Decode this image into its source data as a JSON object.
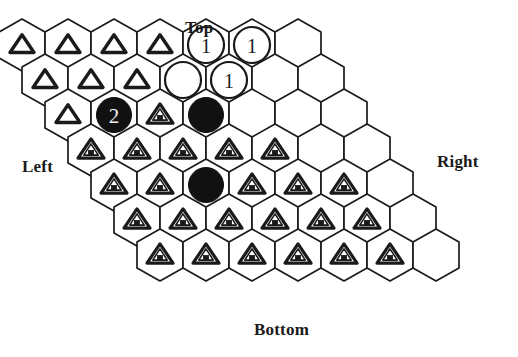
{
  "figure": {
    "kind": "hex-board",
    "orientation": "pointy-top",
    "rows": 7,
    "cols": 7,
    "colors": {
      "line": "#1a1a1a",
      "background": "#ffffff",
      "stone_dark": "#111111",
      "numeral_light": "#f2f2f2"
    },
    "geometry": {
      "hex_width": 46,
      "hex_height": 52,
      "row_step_y": 35,
      "row_offset_x": 23,
      "origin_x": 22,
      "origin_y": 45
    }
  },
  "edge_labels": {
    "top": "Top",
    "bottom": "Bottom",
    "left": "Left",
    "right": "Right"
  },
  "legend": {
    "triangle_open": "open-triangle-marker",
    "triangle_house": "house-triangle-marker",
    "ring": "white-ring-stone",
    "stone": "black-stone",
    "empty": "empty-cell"
  },
  "board": {
    "cells": [
      [
        {
          "type": "triangle_open",
          "label": ""
        },
        {
          "type": "triangle_open",
          "label": ""
        },
        {
          "type": "triangle_open",
          "label": ""
        },
        {
          "type": "triangle_open",
          "label": ""
        },
        {
          "type": "ring",
          "label": "1"
        },
        {
          "type": "ring",
          "label": "1"
        },
        {
          "type": "empty",
          "label": ""
        }
      ],
      [
        {
          "type": "triangle_open",
          "label": ""
        },
        {
          "type": "triangle_open",
          "label": ""
        },
        {
          "type": "triangle_open",
          "label": ""
        },
        {
          "type": "ring",
          "label": ""
        },
        {
          "type": "ring",
          "label": "1"
        },
        {
          "type": "empty",
          "label": ""
        },
        {
          "type": "empty",
          "label": ""
        }
      ],
      [
        {
          "type": "triangle_open",
          "label": ""
        },
        {
          "type": "stone",
          "label": "2"
        },
        {
          "type": "triangle_house",
          "label": ""
        },
        {
          "type": "stone",
          "label": ""
        },
        {
          "type": "empty",
          "label": ""
        },
        {
          "type": "empty",
          "label": ""
        },
        {
          "type": "empty",
          "label": ""
        }
      ],
      [
        {
          "type": "triangle_house",
          "label": ""
        },
        {
          "type": "triangle_house",
          "label": ""
        },
        {
          "type": "triangle_house",
          "label": ""
        },
        {
          "type": "triangle_house",
          "label": ""
        },
        {
          "type": "triangle_house",
          "label": ""
        },
        {
          "type": "empty",
          "label": ""
        },
        {
          "type": "empty",
          "label": ""
        }
      ],
      [
        {
          "type": "triangle_house",
          "label": ""
        },
        {
          "type": "triangle_house",
          "label": ""
        },
        {
          "type": "stone",
          "label": ""
        },
        {
          "type": "triangle_house",
          "label": ""
        },
        {
          "type": "triangle_house",
          "label": ""
        },
        {
          "type": "triangle_house",
          "label": ""
        },
        {
          "type": "empty",
          "label": ""
        }
      ],
      [
        {
          "type": "triangle_house",
          "label": ""
        },
        {
          "type": "triangle_house",
          "label": ""
        },
        {
          "type": "triangle_house",
          "label": ""
        },
        {
          "type": "triangle_house",
          "label": ""
        },
        {
          "type": "triangle_house",
          "label": ""
        },
        {
          "type": "triangle_house",
          "label": ""
        },
        {
          "type": "empty",
          "label": ""
        }
      ],
      [
        {
          "type": "triangle_house",
          "label": ""
        },
        {
          "type": "triangle_house",
          "label": ""
        },
        {
          "type": "triangle_house",
          "label": ""
        },
        {
          "type": "triangle_house",
          "label": ""
        },
        {
          "type": "triangle_house",
          "label": ""
        },
        {
          "type": "triangle_house",
          "label": ""
        },
        {
          "type": "empty",
          "label": ""
        }
      ]
    ]
  }
}
